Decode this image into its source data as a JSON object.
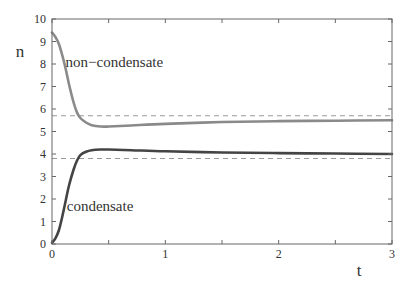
{
  "chart_data": {
    "type": "line",
    "title": "",
    "xlabel": "t",
    "ylabel": "n",
    "xlim": [
      0,
      3
    ],
    "ylim": [
      0,
      10
    ],
    "x_ticks": [
      0,
      1,
      2,
      3
    ],
    "x_minor_ticks": [
      0.5,
      1.5,
      2.5
    ],
    "y_ticks": [
      0,
      1,
      2,
      3,
      4,
      5,
      6,
      7,
      8,
      9,
      10
    ],
    "grid": false,
    "legend": "none (inline annotations)",
    "series": [
      {
        "name": "non−condensate",
        "color": "#8a8a8a",
        "style": "solid",
        "x": [
          0,
          0.03,
          0.06,
          0.09,
          0.12,
          0.15,
          0.19,
          0.22,
          0.25,
          0.3,
          0.35,
          0.43,
          0.5,
          0.7,
          1.0,
          1.5,
          2.0,
          2.5,
          3.0
        ],
        "y": [
          9.4,
          9.2,
          8.9,
          8.4,
          7.8,
          7.1,
          6.3,
          5.85,
          5.6,
          5.4,
          5.28,
          5.22,
          5.22,
          5.27,
          5.34,
          5.42,
          5.46,
          5.48,
          5.5
        ]
      },
      {
        "name": "condensate",
        "color": "#444444",
        "style": "solid",
        "x": [
          0,
          0.03,
          0.06,
          0.09,
          0.12,
          0.15,
          0.19,
          0.22,
          0.25,
          0.3,
          0.35,
          0.43,
          0.5,
          0.7,
          1.0,
          1.5,
          2.0,
          2.5,
          3.0
        ],
        "y": [
          0.05,
          0.25,
          0.6,
          1.2,
          1.9,
          2.6,
          3.3,
          3.7,
          3.95,
          4.1,
          4.17,
          4.2,
          4.2,
          4.17,
          4.12,
          4.07,
          4.04,
          4.02,
          4.0
        ]
      },
      {
        "name": "non-condensate asymptote",
        "color": "#9a9a9a",
        "style": "dashed",
        "x": [
          0,
          3
        ],
        "y": [
          5.7,
          5.7
        ]
      },
      {
        "name": "condensate asymptote",
        "color": "#9a9a9a",
        "style": "dashed",
        "x": [
          0,
          3
        ],
        "y": [
          3.8,
          3.8
        ]
      }
    ],
    "annotations": [
      {
        "text": "non−condensate",
        "x": 0.12,
        "y": 7.85
      },
      {
        "text": "condensate",
        "x": 0.13,
        "y": 1.45
      }
    ]
  },
  "labels": {
    "xlabel": "t",
    "ylabel": "n",
    "annot_noncondensate": "non−condensate",
    "annot_condensate": "condensate"
  },
  "colors": {
    "frame": "#666666",
    "text": "#333333",
    "noncondensate": "#8a8a8a",
    "condensate": "#444444",
    "dashed": "#9a9a9a"
  }
}
